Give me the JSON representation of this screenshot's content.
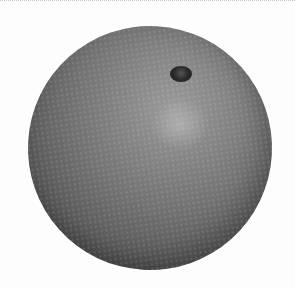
{
  "image": {
    "subject": "orange",
    "description": "A single round orange citrus fruit photographed from above on a white background, rendered in grayscale, with the stem end visible near the top-right.",
    "colors": {
      "background": "#fdfdfd",
      "fruit_mid": "#7a7a7a",
      "fruit_shadow": "#3a3a3a",
      "stem": "#222222"
    }
  }
}
